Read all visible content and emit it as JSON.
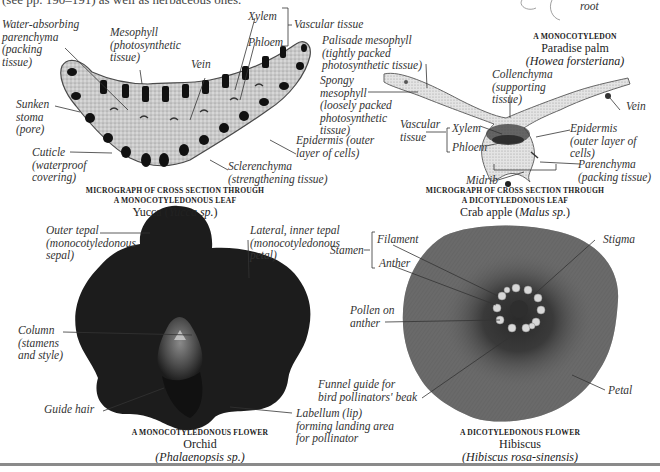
{
  "header": {
    "intro_text": "(see pp. 190–191) as well as herbaceous ones."
  },
  "palm": {
    "root_label": "root",
    "caption_title": "A MONOCOTYLEDON",
    "caption_name": "Paradise palm",
    "caption_species": "(Howea forsteriana)"
  },
  "yucca_leaf": {
    "labels": {
      "water_absorbing": "Water-absorbing\nparenchyma\n(packing\ntissue)",
      "mesophyll": "Mesophyll\n(photosynthetic\ntissue)",
      "vein": "Vein",
      "xylem": "Xylem",
      "phloem": "Phloem",
      "vascular_tissue": "Vascular tissue",
      "sunken_stoma": "Sunken\nstoma\n(pore)",
      "cuticle": "Cuticle\n(waterproof\ncovering)",
      "sclerenchyma": "Sclerenchyma\n(strengthening tissue)",
      "epidermis": "Epidermis (outer\nlayer of cells)"
    },
    "caption_title_line1": "MICROGRAPH OF CROSS SECTION THROUGH",
    "caption_title_line2": "A MONOCOTYLEDONOUS LEAF",
    "caption_name": "Yucca",
    "caption_species": "Yucca sp."
  },
  "crab_apple_leaf": {
    "labels": {
      "palisade": "Palisade mesophyll\n(tightly packed\nphotosynthetic tissue)",
      "spongy": "Spongy\nmesophyll\n(loosely packed\nphotosynthetic\ntissue)",
      "collenchyma": "Collenchyma\n(supporting\ntissue)",
      "vein": "Vein",
      "vascular_tissue": "Vascular\ntissue",
      "xylem": "Xylem",
      "phloem": "Phloem",
      "epidermis": "Epidermis\n(outer layer of\ncells)",
      "parenchyma": "Parenchyma\n(packing tissue)",
      "midrib": "Midrib"
    },
    "caption_title_line1": "MICROGRAPH OF CROSS SECTION THROUGH",
    "caption_title_line2": "A DICOTYLEDONOUS LEAF",
    "caption_name": "Crab apple",
    "caption_species": "Malus sp."
  },
  "orchid": {
    "labels": {
      "outer_tepal": "Outer tepal\n(monocotyledonous\nsepal)",
      "lateral_tepal": "Lateral, inner tepal\n(monocotyledonous\npetal)",
      "column": "Column\n(stamens\nand style)",
      "guide_hair": "Guide hair",
      "labellum": "Labellum (lip)\nforming landing area\nfor pollinator"
    },
    "caption_title": "A MONOCOTYLEDONOUS FLOWER",
    "caption_name": "Orchid",
    "caption_species": "(Phalaenopsis sp.)"
  },
  "hibiscus": {
    "labels": {
      "stamen": "Stamen",
      "filament": "Filament",
      "anther": "Anther",
      "stigma": "Stigma",
      "pollen": "Pollen on\nanther",
      "funnel": "Funnel guide for\nbird pollinators' beak",
      "petal": "Petal"
    },
    "caption_title": "A DICOTYLEDONOUS FLOWER",
    "caption_name": "Hibiscus",
    "caption_species": "(Hibiscus rosa-sinensis)"
  },
  "colors": {
    "background": "#ffffff",
    "label_text": "#333333",
    "orchid_petal": "#1c1c1c",
    "hibiscus_petal": "#5e5e5e",
    "leaf_tissue": "#bdbdbd",
    "rule": "#8a8a8a"
  }
}
